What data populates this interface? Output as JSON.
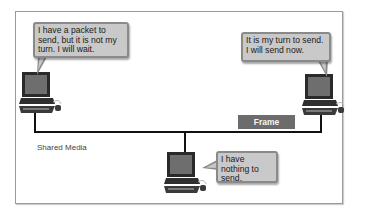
{
  "diagram": {
    "media_label": "Shared Media",
    "frame_label": "Frame",
    "hosts": [
      {
        "id": "host-left",
        "icon": "desktop-computer-icon",
        "message": "I have a packet to send, but it is not my turn. I will wait."
      },
      {
        "id": "host-right",
        "icon": "desktop-computer-icon",
        "message": "It is my turn to send. I will send now."
      },
      {
        "id": "host-bottom",
        "icon": "desktop-computer-icon",
        "message": "I have nothing to send."
      }
    ],
    "colors": {
      "bubble_fill": "#c9c9c9",
      "bubble_border": "#8a8a8a",
      "frame_fill": "#6c6c6c",
      "bus_line": "#111111",
      "monitor_screen": "#6e6e6e"
    }
  }
}
